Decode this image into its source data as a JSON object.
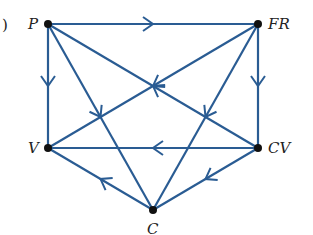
{
  "figure_label": ")",
  "edge_color": "#2a5c93",
  "nodes": [
    {
      "id": "P",
      "label": "P",
      "x": 48,
      "y": 24
    },
    {
      "id": "FR",
      "label": "FR",
      "x": 258,
      "y": 24
    },
    {
      "id": "V",
      "label": "V",
      "x": 48,
      "y": 148
    },
    {
      "id": "CV",
      "label": "CV",
      "x": 258,
      "y": 148
    },
    {
      "id": "C",
      "label": "C",
      "x": 153,
      "y": 210
    }
  ],
  "edges": [
    {
      "from": "P",
      "to": "FR"
    },
    {
      "from": "P",
      "to": "V"
    },
    {
      "from": "FR",
      "to": "CV"
    },
    {
      "from": "CV",
      "to": "V"
    },
    {
      "from": "CV",
      "to": "P"
    },
    {
      "from": "FR",
      "to": "V"
    },
    {
      "from": "FR",
      "to": "C"
    },
    {
      "from": "P",
      "to": "C"
    },
    {
      "from": "CV",
      "to": "C"
    },
    {
      "from": "C",
      "to": "V"
    }
  ]
}
